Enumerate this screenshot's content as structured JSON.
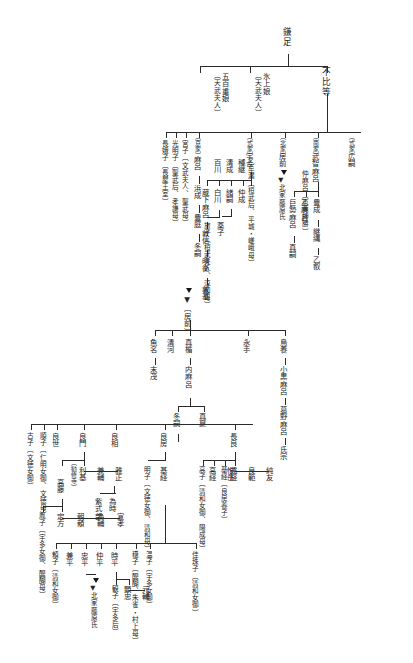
{
  "meta": {
    "orientation": "vertical-rtl",
    "line_color": "#2b2b2b",
    "text_color": "#232323",
    "background": "#ffffff"
  },
  "nodes": {
    "kamatari": "鎌足",
    "fuhito": "不比等",
    "nagaue_no_iratsume": "氷上娘",
    "nagaue_note": "〔天武夫人〕",
    "ioe_no_iratsume": "五百重娘",
    "ioe_note": "〔天武夫人〕",
    "kyoke_tag": "〔京家〕",
    "maro": "麻呂",
    "hamanari": "浜成",
    "toyotsugu": "豊庭",
    "fuyutsugu_kyo": "冬嗣",
    "miyako": "宮子〔文武夫人、聖武母〕",
    "komyoshi": "光明子〔聖武后、孝謙母〕",
    "nagako": "長娥子〔長屋王室〕",
    "shikike_tag": "〔式家〕",
    "umakai": "宇合",
    "kusumaro": "蔵下麻呂",
    "hirotsugu_shiki": "百川",
    "kiyonari": "清成",
    "momokawa": "白川",
    "tabiko": "旅子〔桓武夫人、淳和母〕",
    "otsugu": "緒嗣",
    "kusuko": "薬子",
    "atsunobu": "敦信",
    "akihira": "明衡",
    "atsumoto": "敦基",
    "hokke_tag": "〔北家〕",
    "fusasaki": "房前",
    "hokke_marker_label": "▼北家藤原氏",
    "nanke_tag": "〔南家〕",
    "muchimaro": "武智麻呂",
    "otomaro": "乙麻呂",
    "kosemaro": "巨勢麻呂",
    "tsugutada": "真嗣",
    "toyonari": "豊成",
    "tsugunawa": "継縄",
    "otsugu_nan": "乙叡",
    "nakamaro": "仲麻呂〔恵美押勝〕",
    "shikike2_tag": "〔式家〕",
    "hirotsugu": "広嗣",
    "tadatsugu": "良継",
    "otsugu2": "乙牟漏〔桓武后、平城・嵯峨母〕",
    "nakanari": "仲成",
    "kiyonari2": "種継",
    "fusasaki_marker": "▼〔房前〕",
    "kiyokawa": "清河",
    "matate": "真楯",
    "nagate": "永手",
    "uonona": "魚名",
    "suemichi": "末茂",
    "toritaka": "鳥養",
    "oguromaro": "小黒麻呂",
    "kadonomaro": "葛野麻呂",
    "ujimune": "氏宗",
    "uchimaro": "内麻呂",
    "manatsu": "真夏",
    "fuyutsugu": "冬嗣",
    "nagayoshi": "良世",
    "junshi": "順子〔仁明女御、文徳母〕",
    "furuko": "古子〔文徳女御〕",
    "yoshikado": "良門",
    "yoshimi": "良相",
    "yoshifusa": "良房",
    "akirakeiko": "明子〔文徳女御、清和母〕",
    "mototsune": "基経",
    "nagara": "長良",
    "tookitsune": "遠経",
    "yoshinori": "良範",
    "sumitomo": "純友",
    "mototsune_note": "基経〔良房養子〕",
    "takatsune": "高経",
    "koreoka": "惟岳",
    "bihaya": "備基",
    "takaiko": "高子〔清和女御、陽成母〕",
    "toshimoto": "利基",
    "kanesuke": "兼輔",
    "masatada": "雅正",
    "tametoki": "為時",
    "murasaki": "紫式部",
    "takafuji": "高藤",
    "sadakata": "定方",
    "asayori": "朝頼",
    "tamesuke": "為輔",
    "nobutaka": "宣孝",
    "inshi": "胤子〔宇多女御、醍醐母〕",
    "takafuji_note": "〔勧修寺〕",
    "kashuko": "佳珠子〔清和女御〕",
    "onshi": "温子〔宇多女御〕",
    "yasuko": "穏子〔醍醐、朱雀・村上母〕",
    "tokihira": "時平",
    "akitada": "顕忠",
    "motosuke": "元輔",
    "kanshi": "観子〔宇多后〕",
    "nakahira": "仲平",
    "tadahira": "忠平",
    "kanehira": "兼平",
    "yoriko": "頼子〔清和女御〕"
  }
}
